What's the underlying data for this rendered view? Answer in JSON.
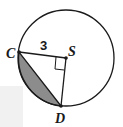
{
  "diagram": {
    "type": "circle-segment",
    "circle": {
      "center_label": "S",
      "radius_label": "3"
    },
    "points": [
      {
        "label": "C"
      },
      {
        "label": "S"
      },
      {
        "label": "D"
      }
    ],
    "segments": [
      "CS",
      "SD",
      "CD"
    ],
    "right_angle_at": "S",
    "shaded_region": "segment between chord CD and arc CD",
    "colors": {
      "stroke": "#1a1a1a",
      "shade": "#8c8c8c",
      "background": "#ffffff"
    }
  }
}
